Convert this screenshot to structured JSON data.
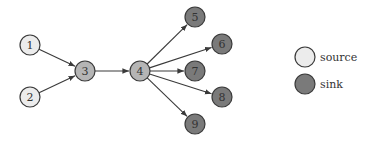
{
  "colors": {
    "source_fill": "#ececec",
    "mid_fill": "#b5b5b5",
    "sink_fill": "#7a7a7a",
    "stroke": "#3a3a3a",
    "edge": "#3a3a3a"
  },
  "nodes": [
    {
      "id": "1",
      "label": "1",
      "x": 30,
      "y": 45,
      "type": "source"
    },
    {
      "id": "2",
      "label": "2",
      "x": 30,
      "y": 97,
      "type": "source"
    },
    {
      "id": "3",
      "label": "3",
      "x": 85,
      "y": 71,
      "type": "mid"
    },
    {
      "id": "4",
      "label": "4",
      "x": 140,
      "y": 71,
      "type": "mid"
    },
    {
      "id": "5",
      "label": "5",
      "x": 195,
      "y": 17,
      "type": "sink"
    },
    {
      "id": "6",
      "label": "6",
      "x": 222,
      "y": 44,
      "type": "sink"
    },
    {
      "id": "7",
      "label": "7",
      "x": 195,
      "y": 71,
      "type": "sink"
    },
    {
      "id": "8",
      "label": "8",
      "x": 222,
      "y": 97,
      "type": "sink"
    },
    {
      "id": "9",
      "label": "9",
      "x": 195,
      "y": 124,
      "type": "sink"
    }
  ],
  "edges": [
    {
      "from": "1",
      "to": "3"
    },
    {
      "from": "2",
      "to": "3"
    },
    {
      "from": "3",
      "to": "4"
    },
    {
      "from": "4",
      "to": "5"
    },
    {
      "from": "4",
      "to": "6"
    },
    {
      "from": "4",
      "to": "7"
    },
    {
      "from": "4",
      "to": "8"
    },
    {
      "from": "4",
      "to": "9"
    }
  ],
  "legend": {
    "items": [
      {
        "label": "source",
        "type": "source",
        "x": 305,
        "y": 57
      },
      {
        "label": "sink",
        "type": "sink",
        "x": 305,
        "y": 84
      }
    ]
  }
}
